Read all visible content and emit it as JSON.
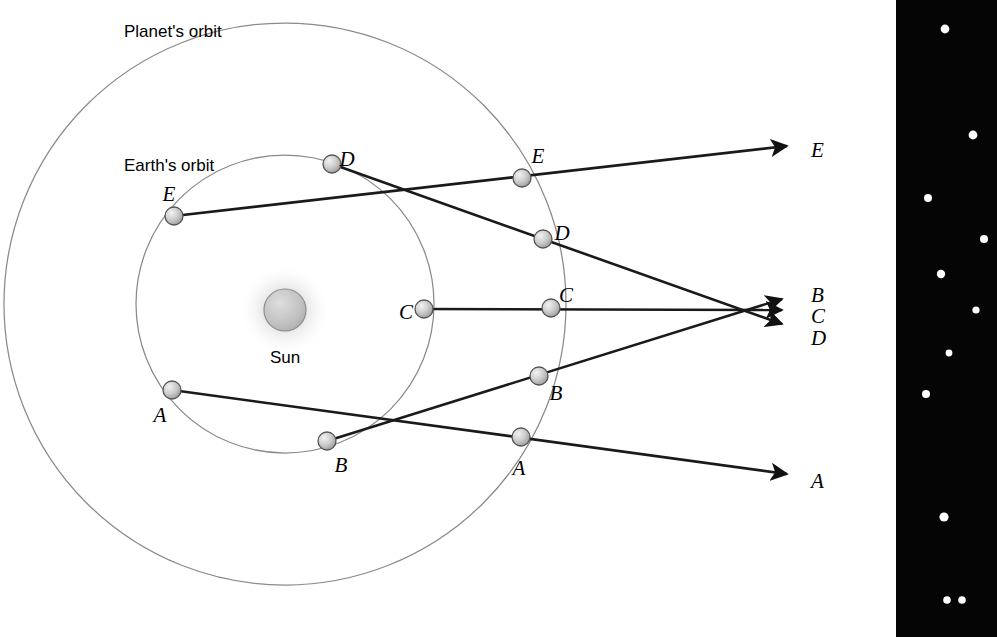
{
  "figure": {
    "title_labels": {
      "planet_orbit": "Planet's orbit",
      "earth_orbit": "Earth's orbit",
      "sun": "Sun"
    },
    "colors": {
      "background": "#ffffff",
      "orbit_line": "#8a8a8a",
      "sight_line": "#1a1a1a",
      "body_fill": "#c9c9c9",
      "body_stroke": "#4a4a4a",
      "sun_fill": "#c4c4c4",
      "sun_glow": "#bdbdbd",
      "sky_panel": "#050505",
      "star": "#ffffff",
      "text": "#000000"
    },
    "orbits": {
      "planet": {
        "cx": 285,
        "cy": 304,
        "r": 281,
        "label_x": 124,
        "label_y": 22
      },
      "earth": {
        "cx": 285,
        "cy": 304,
        "r": 149,
        "label_x": 124,
        "label_y": 156
      }
    },
    "sun": {
      "cx": 285,
      "cy": 310,
      "r": 21,
      "glow_r": 46,
      "label_x": 285,
      "label_y": 358
    },
    "earth_positions": [
      {
        "id": "A",
        "x": 172,
        "y": 390,
        "label_x": 160,
        "label_y": 417,
        "r": 9
      },
      {
        "id": "B",
        "x": 327,
        "y": 441,
        "label_x": 341,
        "label_y": 467,
        "r": 9
      },
      {
        "id": "C",
        "x": 424,
        "y": 309,
        "label_x": 406,
        "label_y": 314,
        "r": 9
      },
      {
        "id": "D",
        "x": 332,
        "y": 164,
        "label_x": 347,
        "label_y": 161,
        "r": 9
      },
      {
        "id": "E",
        "x": 174,
        "y": 216,
        "label_x": 169,
        "label_y": 196,
        "r": 9
      }
    ],
    "planet_positions": [
      {
        "id": "A",
        "x": 521,
        "y": 437,
        "label_x": 519,
        "label_y": 470,
        "r": 9
      },
      {
        "id": "B",
        "x": 539,
        "y": 376,
        "label_x": 556,
        "label_y": 395,
        "r": 9
      },
      {
        "id": "C",
        "x": 551,
        "y": 308,
        "label_x": 566,
        "label_y": 297,
        "r": 9
      },
      {
        "id": "D",
        "x": 543,
        "y": 239,
        "label_x": 562,
        "label_y": 235,
        "r": 9
      },
      {
        "id": "E",
        "x": 522,
        "y": 178,
        "label_x": 538,
        "label_y": 158,
        "r": 9
      }
    ],
    "sight_lines": [
      {
        "id": "A",
        "from_x": 172,
        "from_y": 390,
        "through_x": 521,
        "through_y": 437,
        "tip_x": 787,
        "tip_y": 474
      },
      {
        "id": "B",
        "from_x": 327,
        "from_y": 441,
        "through_x": 539,
        "through_y": 376,
        "tip_x": 782,
        "tip_y": 299
      },
      {
        "id": "C",
        "from_x": 424,
        "from_y": 309,
        "through_x": 551,
        "through_y": 308,
        "tip_x": 782,
        "tip_y": 310
      },
      {
        "id": "D",
        "from_x": 332,
        "from_y": 164,
        "through_x": 543,
        "through_y": 239,
        "tip_x": 782,
        "tip_y": 324
      },
      {
        "id": "E",
        "from_x": 174,
        "from_y": 216,
        "through_x": 522,
        "through_y": 178,
        "tip_x": 787,
        "tip_y": 146
      }
    ],
    "direction_labels": [
      {
        "id": "E",
        "x": 811,
        "y": 152
      },
      {
        "id": "B",
        "x": 811,
        "y": 297
      },
      {
        "id": "C",
        "x": 811,
        "y": 318
      },
      {
        "id": "D",
        "x": 811,
        "y": 340
      },
      {
        "id": "A",
        "x": 811,
        "y": 483
      }
    ],
    "sky_panel": {
      "x": 896,
      "y": 0,
      "width": 101,
      "height": 637,
      "stars": [
        {
          "x": 945,
          "y": 29,
          "r": 4.4
        },
        {
          "x": 973,
          "y": 135,
          "r": 4.4
        },
        {
          "x": 928,
          "y": 198,
          "r": 4.0
        },
        {
          "x": 984,
          "y": 239,
          "r": 4.0
        },
        {
          "x": 941,
          "y": 274,
          "r": 4.2
        },
        {
          "x": 976,
          "y": 310,
          "r": 3.6
        },
        {
          "x": 949,
          "y": 353,
          "r": 3.4
        },
        {
          "x": 926,
          "y": 394,
          "r": 4.0
        },
        {
          "x": 956,
          "y": 355,
          "r": 0
        },
        {
          "x": 955,
          "y": 356,
          "r": 0
        },
        {
          "x": 944,
          "y": 517,
          "r": 4.6
        },
        {
          "x": 947,
          "y": 600,
          "r": 3.8
        },
        {
          "x": 962,
          "y": 600,
          "r": 3.8
        }
      ]
    }
  }
}
